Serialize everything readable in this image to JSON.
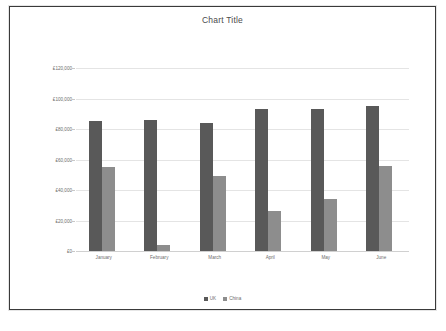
{
  "chart_data": {
    "type": "bar",
    "title": "Chart Title",
    "xlabel": "",
    "ylabel": "",
    "categories": [
      "January",
      "February",
      "March",
      "April",
      "May",
      "June"
    ],
    "series": [
      {
        "name": "UK",
        "color": "#595959",
        "values": [
          85000,
          86000,
          84000,
          93000,
          93000,
          95000
        ]
      },
      {
        "name": "China",
        "color": "#8d8d8d",
        "values": [
          55000,
          4000,
          49000,
          26000,
          34000,
          56000
        ]
      }
    ],
    "ylim": [
      0,
      120000
    ],
    "ytick_values": [
      0,
      20000,
      40000,
      60000,
      80000,
      100000,
      120000
    ],
    "ytick_labels": [
      "£0",
      "£20,000",
      "£40,000",
      "£60,000",
      "£80,000",
      "£100,000",
      "£120,000"
    ],
    "grid": true,
    "legend_position": "bottom",
    "currency_symbol": "£"
  },
  "legend": {
    "items": [
      {
        "label": "UK",
        "color": "#595959"
      },
      {
        "label": "China",
        "color": "#8d8d8d"
      }
    ]
  }
}
